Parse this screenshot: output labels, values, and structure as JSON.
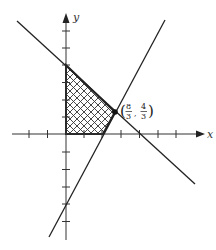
{
  "diagram": {
    "type": "linear-programming feasible region",
    "axes": {
      "x_label": "x",
      "y_label": "y",
      "x_ticks": [
        -2,
        -1,
        1,
        2,
        3,
        4,
        5,
        6
      ],
      "y_ticks": [
        -6,
        -5,
        -4,
        -3,
        -2,
        -1,
        1,
        2,
        3,
        4,
        5,
        6
      ]
    },
    "lines": [
      {
        "name": "x + y = 4",
        "slope": -1,
        "intercept": 4
      },
      {
        "name": "y = 2x - 4",
        "slope": 2,
        "intercept": -4
      }
    ],
    "region": {
      "vertices": [
        [
          0,
          0
        ],
        [
          0,
          4
        ],
        [
          2.6667,
          1.3333
        ],
        [
          2,
          0
        ]
      ],
      "fill": "crosshatch"
    },
    "point_label": {
      "x_num": "8",
      "x_den": "3",
      "y_num": "4",
      "y_den": "3",
      "open": "(",
      "close": ")",
      "comma": ","
    },
    "colors": {
      "ink": "#222222",
      "background": "#ffffff"
    }
  }
}
